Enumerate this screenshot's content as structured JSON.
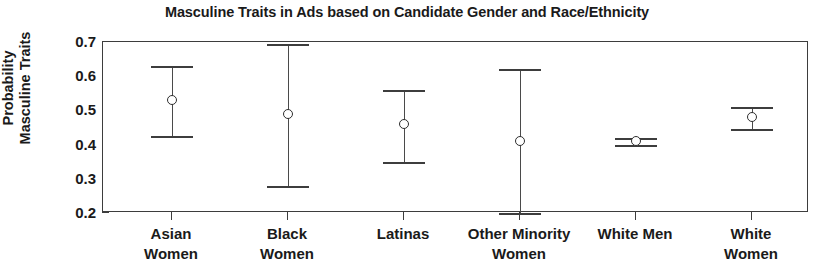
{
  "chart_data": {
    "type": "scatter",
    "title": "Masculine Traits in Ads based on Candidate Gender and Race/Ethnicity",
    "xlabel": "",
    "ylabel": "Probability Masculine Traits",
    "ylabel_lines": [
      "Probability",
      "Masculine Traits"
    ],
    "ylim": [
      0.2,
      0.7
    ],
    "yticks": [
      0.2,
      0.3,
      0.4,
      0.5,
      0.6,
      0.7
    ],
    "ytick_labels": [
      "0.2",
      "0.3",
      "0.4",
      "0.5",
      "0.6",
      "0.7"
    ],
    "grid": false,
    "legend": null,
    "categories": [
      "Asian Women",
      "Black Women",
      "Latinas",
      "Other Minority Women",
      "White Men",
      "White Women"
    ],
    "category_label_lines": [
      [
        "Asian",
        "Women"
      ],
      [
        "Black",
        "Women"
      ],
      [
        "Latinas",
        ""
      ],
      [
        "Other Minority",
        "Women"
      ],
      [
        "White Men",
        ""
      ],
      [
        "White",
        "Women"
      ]
    ],
    "values": [
      0.53,
      0.49,
      0.46,
      0.41,
      0.41,
      0.48
    ],
    "ci_lower": [
      0.425,
      0.28,
      0.35,
      0.2,
      0.4,
      0.445
    ],
    "ci_upper": [
      0.63,
      0.695,
      0.56,
      0.62,
      0.42,
      0.51
    ],
    "series": [
      {
        "name": "Probability Masculine Traits",
        "points": [
          {
            "category": "Asian Women",
            "value": 0.53,
            "lower": 0.425,
            "upper": 0.63
          },
          {
            "category": "Black Women",
            "value": 0.49,
            "lower": 0.28,
            "upper": 0.695
          },
          {
            "category": "Latinas",
            "value": 0.46,
            "lower": 0.35,
            "upper": 0.56
          },
          {
            "category": "Other Minority Women",
            "value": 0.41,
            "lower": 0.2,
            "upper": 0.62
          },
          {
            "category": "White Men",
            "value": 0.41,
            "lower": 0.4,
            "upper": 0.42
          },
          {
            "category": "White Women",
            "value": 0.48,
            "lower": 0.445,
            "upper": 0.51
          }
        ]
      }
    ],
    "marker": "open-circle",
    "errorbar_style": "capped",
    "colors": {
      "axis": "#3d3d3d",
      "marker": "#2e2e2e",
      "errorbar": "#3d3d3d",
      "text": "#1a1a1a",
      "background": "#ffffff"
    }
  }
}
